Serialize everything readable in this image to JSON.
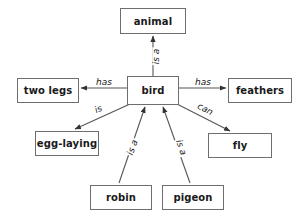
{
  "diagram": {
    "type": "semantic-network",
    "background_color": "#ffffff",
    "node_border_color": "#6e6e6e",
    "edge_color": "#555555",
    "text_color": "#1a1a1a",
    "nodes": [
      {
        "id": "animal",
        "label": "animal",
        "x": 120,
        "y": 8,
        "w": 66,
        "h": 26,
        "font_size": 10
      },
      {
        "id": "two-legs",
        "label": "two legs",
        "x": 17,
        "y": 78,
        "w": 62,
        "h": 25,
        "font_size": 10
      },
      {
        "id": "bird",
        "label": "bird",
        "x": 127,
        "y": 76,
        "w": 52,
        "h": 29,
        "font_size": 10
      },
      {
        "id": "feathers",
        "label": "feathers",
        "x": 228,
        "y": 78,
        "w": 64,
        "h": 25,
        "font_size": 10
      },
      {
        "id": "egg-laying",
        "label": "egg-laying",
        "x": 35,
        "y": 131,
        "w": 64,
        "h": 25,
        "font_size": 10
      },
      {
        "id": "fly",
        "label": "fly",
        "x": 208,
        "y": 133,
        "w": 64,
        "h": 25,
        "font_size": 10
      },
      {
        "id": "robin",
        "label": "robin",
        "x": 90,
        "y": 185,
        "w": 62,
        "h": 25,
        "font_size": 10
      },
      {
        "id": "pigeon",
        "label": "pigeon",
        "x": 162,
        "y": 185,
        "w": 62,
        "h": 25,
        "font_size": 10
      }
    ],
    "edges": [
      {
        "id": "bird-isa-animal",
        "from": "bird",
        "to": "animal",
        "label": "is a",
        "x1": 153,
        "y1": 76,
        "x2": 153,
        "y2": 36,
        "label_x": 148,
        "label_y": 52,
        "rotate": -90
      },
      {
        "id": "bird-has-twolegs",
        "from": "bird",
        "to": "two-legs",
        "label": "has",
        "x1": 127,
        "y1": 88,
        "x2": 81,
        "y2": 88,
        "label_x": 95,
        "label_y": 78,
        "rotate": 0
      },
      {
        "id": "bird-has-feathers",
        "from": "bird",
        "to": "feathers",
        "label": "has",
        "x1": 179,
        "y1": 88,
        "x2": 226,
        "y2": 88,
        "label_x": 194,
        "label_y": 78,
        "rotate": 0
      },
      {
        "id": "bird-is-egglaying",
        "from": "bird",
        "to": "egg-laying",
        "label": "is",
        "x1": 130,
        "y1": 104,
        "x2": 75,
        "y2": 129,
        "label_x": 94,
        "label_y": 105,
        "rotate": -24
      },
      {
        "id": "bird-can-fly",
        "from": "bird",
        "to": "fly",
        "label": "can",
        "x1": 177,
        "y1": 104,
        "x2": 230,
        "y2": 131,
        "label_x": 196,
        "label_y": 105,
        "rotate": 27
      },
      {
        "id": "robin-isa-bird",
        "from": "robin",
        "to": "bird",
        "label": "is a",
        "x1": 119,
        "y1": 183,
        "x2": 145,
        "y2": 107,
        "label_x": 124,
        "label_y": 143,
        "rotate": -71
      },
      {
        "id": "pigeon-isa-bird",
        "from": "pigeon",
        "to": "bird",
        "label": "is a",
        "x1": 190,
        "y1": 183,
        "x2": 163,
        "y2": 107,
        "label_x": 172,
        "label_y": 143,
        "rotate": 71
      }
    ]
  }
}
